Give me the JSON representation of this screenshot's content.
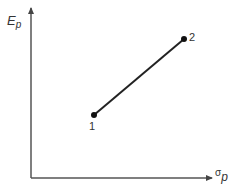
{
  "diagram": {
    "y_axis": {
      "label": "E",
      "label_sub": "p"
    },
    "x_axis": {
      "label": "σ",
      "label_sub": "p"
    },
    "points": [
      {
        "id": "1",
        "label": "1",
        "x": 94,
        "y": 115
      },
      {
        "id": "2",
        "label": "2",
        "x": 184,
        "y": 39
      }
    ],
    "colors": {
      "axis": "#555555",
      "line": "#222222",
      "text": "#333333"
    }
  }
}
